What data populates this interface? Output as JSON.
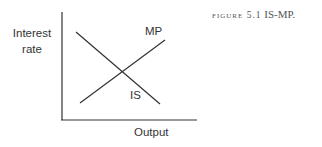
{
  "caption": {
    "figure_label": "Figure 5.1",
    "title": "IS-MP."
  },
  "axes": {
    "ylabel_line1": "Interest",
    "ylabel_line2": "rate",
    "xlabel": "Output"
  },
  "curves": [
    {
      "name": "MP",
      "label": "MP",
      "direction": "upward-sloping"
    },
    {
      "name": "IS",
      "label": "IS",
      "direction": "downward-sloping"
    }
  ],
  "colors": {
    "line": "#333333",
    "text": "#333333",
    "caption": "#555555"
  }
}
